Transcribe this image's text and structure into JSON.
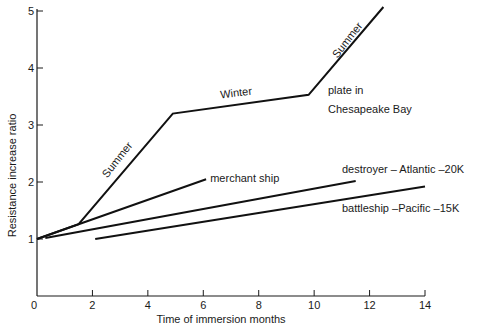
{
  "chart_data": {
    "type": "line",
    "title": "",
    "xlabel": "Time of immersion months",
    "ylabel": "Resistance increase ratio",
    "xlim": [
      0,
      14
    ],
    "ylim": [
      0,
      5
    ],
    "x_ticks": [
      0,
      2,
      4,
      6,
      8,
      10,
      12,
      14
    ],
    "y_ticks": [
      1,
      2,
      3,
      4,
      5
    ],
    "x_tick_labels": [
      "0",
      "2",
      "4",
      "6",
      "8",
      "10",
      "12",
      "14"
    ],
    "y_tick_labels": [
      "1",
      "2",
      "3",
      "4",
      "5"
    ],
    "grid": false,
    "legend": "none (direct labels)",
    "series": [
      {
        "name": "plate in Chesapeake Bay",
        "points": [
          [
            0,
            1.0
          ],
          [
            1.5,
            1.26
          ],
          [
            4.9,
            3.2
          ],
          [
            9.8,
            3.53
          ],
          [
            12.5,
            5.07
          ]
        ]
      },
      {
        "name": "merchant ship",
        "points": [
          [
            0,
            1.0
          ],
          [
            1.5,
            1.26
          ],
          [
            6.1,
            2.05
          ]
        ]
      },
      {
        "name": "destroyer - Atlantic -20K",
        "points": [
          [
            0.3,
            1.02
          ],
          [
            11.5,
            2.02
          ]
        ]
      },
      {
        "name": "battleship -Pacific -15K",
        "points": [
          [
            2.1,
            1.0
          ],
          [
            14,
            1.92
          ]
        ]
      }
    ],
    "annotations": [
      {
        "id": "summer1",
        "text": "Summer",
        "x": 3.0,
        "y": 2.35,
        "rotate": -52
      },
      {
        "id": "winter",
        "text": "Winter",
        "x": 7.2,
        "y": 3.5,
        "rotate": -7
      },
      {
        "id": "summer2",
        "text": "Summer",
        "x": 11.3,
        "y": 4.45,
        "rotate": -52
      },
      {
        "id": "plate1",
        "text": "plate in",
        "x": 10.5,
        "y": 3.55,
        "rotate": 0
      },
      {
        "id": "plate2",
        "text": "Chesapeake Bay",
        "x": 10.5,
        "y": 3.22,
        "rotate": 0
      },
      {
        "id": "merchant",
        "text": "merchant ship",
        "x": 6.25,
        "y": 2.0,
        "rotate": 0
      },
      {
        "id": "destroyer",
        "text": "destroyer – Atlantic –20K",
        "x": 11.0,
        "y": 2.15,
        "rotate": 0
      },
      {
        "id": "battleship",
        "text": "battleship –Pacific –15K",
        "x": 11.0,
        "y": 1.48,
        "rotate": 0
      }
    ]
  }
}
